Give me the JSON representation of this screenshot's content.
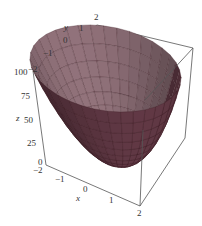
{
  "chart_data": {
    "type": "surface3d",
    "title": "",
    "function": "z = 12.5*(x^2 + y^2)",
    "xlabel": "x",
    "ylabel": "y",
    "zlabel": "z",
    "xlim": [
      -2,
      2
    ],
    "ylim": [
      -2,
      2
    ],
    "zlim": [
      0,
      100
    ],
    "x_ticks": [
      "-2",
      "-1",
      "0",
      "1",
      "2"
    ],
    "y_ticks": [
      "-2",
      "-1",
      "0",
      "1",
      "2"
    ],
    "z_ticks": [
      "0",
      "25",
      "50",
      "75",
      "100"
    ],
    "surface_color": "#8a5a68",
    "mesh_color": "#3a1a22",
    "box": true,
    "grid": false
  },
  "labels": {
    "x": "x",
    "y": "y",
    "z": "z",
    "z0": "0",
    "z25": "25",
    "z50": "50",
    "z75": "75",
    "z100": "100",
    "xm2": "−2",
    "xm1": "−1",
    "x0": "0",
    "x1": "1",
    "x2": "2",
    "ym2": "−2",
    "ym1": "−1",
    "y0": "0",
    "y1": "1",
    "y2": "2"
  }
}
